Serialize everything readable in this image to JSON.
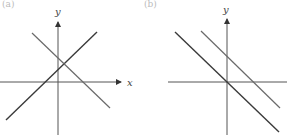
{
  "figure": {
    "panels": [
      {
        "id": "left",
        "panel_label": "(a)",
        "x_axis_label": "x",
        "y_axis_label": "y",
        "description": "Two intersecting lines, one with positive slope and one with negative slope, crossing above the x-axis",
        "lines": [
          {
            "name": "rising-line",
            "slope_sign": "positive",
            "color": "#3a3a3a"
          },
          {
            "name": "falling-line",
            "slope_sign": "negative",
            "color": "#6a6a6a"
          }
        ]
      },
      {
        "id": "right",
        "panel_label": "(b)",
        "x_axis_label": "",
        "y_axis_label": "y",
        "description": "Two parallel lines with negative slope; one passes through the origin, the other is shifted up",
        "lines": [
          {
            "name": "through-origin-line",
            "slope_sign": "negative",
            "color": "#3a3a3a"
          },
          {
            "name": "shifted-parallel-line",
            "slope_sign": "negative",
            "color": "#6a6a6a"
          }
        ]
      }
    ],
    "colors": {
      "axis": "#555555",
      "background": "#ffffff"
    }
  }
}
